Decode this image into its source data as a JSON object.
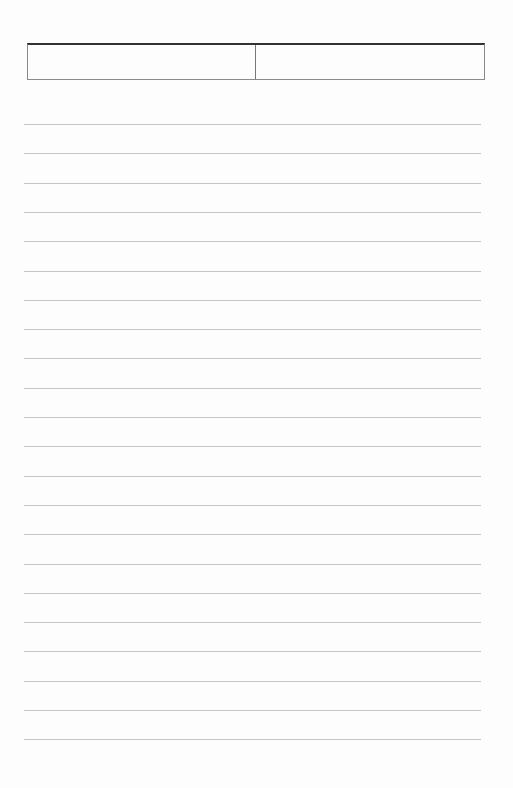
{
  "document": {
    "type": "lined-paper",
    "header": {
      "cells": [
        {
          "label": ""
        },
        {
          "label": ""
        }
      ]
    },
    "rules": {
      "count": 22,
      "first_y": 124,
      "spacing": 29.3,
      "color": "#c4c4c4"
    },
    "background_color": "#fdfdfd"
  }
}
